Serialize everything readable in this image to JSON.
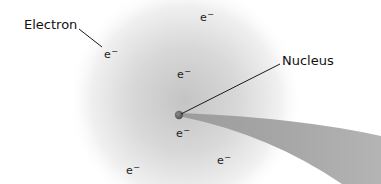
{
  "diagram": {
    "type": "atom-model",
    "labels": {
      "electron": "Electron",
      "nucleus": "Nucleus"
    },
    "electron_symbol": "e",
    "electron_charge": "−",
    "electrons": [
      {
        "x": 104,
        "y": 48
      },
      {
        "x": 200,
        "y": 11
      },
      {
        "x": 177,
        "y": 68
      },
      {
        "x": 176,
        "y": 127
      },
      {
        "x": 217,
        "y": 154
      },
      {
        "x": 126,
        "y": 164
      }
    ],
    "colors": {
      "cloud_center": "#c9c9c9",
      "cloud_edge": "#ffffff",
      "nucleus": "#6e6e6e",
      "beam": "#a9a9a9",
      "leader_line": "#1a1a1a",
      "text": "#111111"
    }
  }
}
